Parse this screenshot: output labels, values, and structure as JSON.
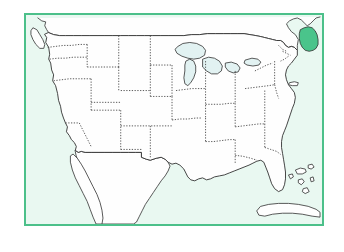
{
  "figure": {
    "kind": "map",
    "highlighted_state": "Maine",
    "title": "",
    "caption": ""
  },
  "colors": {
    "page_background": "#ffffff",
    "frame_border": "#4cc08a",
    "water_background": "#e9f8f1",
    "land_fill": "#fefefe",
    "land_outline": "#2e2e2e",
    "state_border": "#3c3c3c",
    "great_lakes_fill": "#e2f2f2",
    "highlight_fill": "#4ac48b"
  },
  "frame": {
    "x": 24,
    "y": 13,
    "width": 300,
    "height": 213,
    "border_width": 2
  },
  "features": {
    "mainland_label": "Contiguous United States",
    "great_lakes_label": "Great Lakes",
    "canada_label": "Canada",
    "mexico_label": "Mexico",
    "cuba_label": "Cuba",
    "bahamas_label": "Bahamas",
    "vancouver_island_label": "Vancouver Island",
    "long_island_label": "Long Island",
    "highlight_label": "Maine"
  },
  "geometry": {
    "mainland": "M 43 33 L 45 36 L 44 41 L 47 46 L 48 53 L 47 58 L 49 62 L 50 69 L 52 74 L 51 80 L 54 85 L 56 93 L 57 100 L 59 106 L 60 112 L 62 118 L 64 123 L 66 127 L 65 132 L 68 136 L 70 140 L 73 143 L 75 147 L 74 151 L 77 153 L 80 152 L 84 153 L 90 153 L 97 153 L 104 153 L 112 153 L 120 153 L 128 153 L 135 153 L 141 153 L 141 158 L 146 160 L 150 161 L 156 159 L 161 158 L 165 160 L 168 163 L 172 165 L 176 164 L 180 166 L 184 170 L 186 174 L 188 178 L 191 181 L 195 182 L 199 180 L 203 179 L 207 181 L 211 180 L 215 178 L 220 177 L 225 176 L 230 174 L 235 172 L 240 170 L 245 168 L 250 166 L 254 164 L 258 162 L 262 161 L 265 163 L 267 168 L 269 173 L 271 179 L 273 185 L 276 190 L 280 193 L 284 191 L 286 186 L 287 180 L 287 173 L 286 166 L 285 160 L 284 154 L 283 148 L 283 142 L 284 136 L 286 131 L 288 126 L 290 120 L 292 114 L 294 108 L 296 103 L 297 97 L 296 92 L 293 88 L 290 84 L 288 79 L 287 74 L 288 69 L 290 65 L 293 62 L 296 58 L 299 54 L 299 49 L 296 46 L 293 45 L 290 46 L 287 44 L 285 41 L 282 39 L 278 39 L 274 38 L 270 37 L 266 36 L 262 35 L 257 34 L 251 33 L 245 32 L 238 32 L 231 32 L 224 32 L 216 32 L 208 32 L 200 33 L 192 33 L 184 34 L 176 34 L 168 34 L 160 34 L 152 34 L 144 34 L 136 34 L 128 34 L 120 34 L 112 34 L 104 34 L 96 34 L 88 34 L 80 34 L 72 34 L 64 34 L 58 34 L 52 33 L 47 31 Z",
    "great_lakes": [
      "M 178 45 L 183 42 L 190 41 L 197 42 L 203 45 L 206 49 L 205 54 L 200 57 L 194 58 L 188 57 L 182 55 L 177 52 L 175 48 Z",
      "M 186 60 L 190 58 L 194 60 L 196 65 L 196 71 L 194 77 L 191 82 L 188 85 L 185 83 L 184 77 L 185 70 L 185 64 Z",
      "M 203 58 L 209 56 L 215 57 L 220 60 L 223 65 L 222 70 L 218 73 L 212 73 L 207 70 L 203 66 Z",
      "M 226 62 L 232 61 L 238 63 L 241 67 L 239 71 L 234 72 L 229 70 L 226 66 Z",
      "M 246 59 L 253 57 L 259 58 L 262 61 L 260 64 L 254 65 L 248 64 L 245 62 Z"
    ],
    "state_borders": [
      "M 46 46 L 54 45 L 62 44 L 70 44 L 78 43 L 86 43",
      "M 86 43 L 86 50 L 86 58 L 86 66",
      "M 48 58 L 56 57 L 64 57 L 72 56 L 80 56 L 86 56",
      "M 86 66 L 94 66 L 102 66 L 110 66 L 118 66",
      "M 118 34 L 118 42 L 118 50 L 118 58 L 118 66",
      "M 118 66 L 118 74 L 118 82 L 118 90",
      "M 52 80 L 60 79 L 68 78 L 76 78 L 84 78 L 90 78",
      "M 90 78 L 90 86 L 90 94 L 90 102 L 90 110",
      "M 90 110 L 98 110 L 106 110 L 114 110 L 120 110",
      "M 120 90 L 128 90 L 136 90 L 144 90 L 150 90",
      "M 150 34 L 150 42 L 150 50 L 150 58 L 150 64",
      "M 150 64 L 158 64 L 166 64 L 172 64",
      "M 150 64 L 150 72 L 150 80 L 150 88 L 150 96",
      "M 120 110 L 120 118 L 120 126 L 120 134 L 120 142 L 120 150",
      "M 150 96 L 156 96 L 162 96 L 168 96 L 172 96",
      "M 172 64 L 172 72 L 172 80 L 172 88 L 172 96",
      "M 172 96 L 172 104 L 172 112 L 172 120",
      "M 120 126 L 128 126 L 136 126 L 144 126 L 152 126 L 160 126 L 168 126 L 172 126",
      "M 150 126 L 150 134 L 150 142 L 150 150 L 150 158",
      "M 172 120 L 180 119 L 188 119 L 196 118 L 202 118",
      "M 202 50 L 202 58 L 200 64",
      "M 176 90 L 184 89 L 192 88 L 200 88 L 206 88",
      "M 206 60 L 206 68 L 206 76 L 206 84 L 206 88",
      "M 206 88 L 206 96 L 206 104 L 206 112 L 206 118",
      "M 206 118 L 206 126 L 206 134 L 206 142",
      "M 206 104 L 214 104 L 222 104 L 230 103 L 236 103",
      "M 236 70 L 236 78 L 236 86 L 236 94 L 236 103",
      "M 236 103 L 236 111 L 236 119 L 236 127",
      "M 236 127 L 244 126 L 252 125 L 260 124 L 266 124",
      "M 206 142 L 214 142 L 222 141 L 230 140 L 236 140",
      "M 236 140 L 236 148 L 236 156 L 236 164",
      "M 266 90 L 266 98 L 266 106 L 266 114 L 266 124",
      "M 266 124 L 266 132 L 266 140 L 266 148",
      "M 246 88 L 254 87 L 262 86 L 270 85 L 276 84",
      "M 276 60 L 276 68 L 276 76 L 276 84",
      "M 276 84 L 278 92 L 280 98",
      "M 256 70 L 262 67 L 268 64 L 274 62",
      "M 266 148 L 272 150 L 278 152 L 282 155",
      "M 284 50 L 288 52 L 292 54",
      "M 280 44 L 284 48 L 288 50",
      "M 290 55 L 286 58 L 282 60",
      "M 236 156 L 244 157 L 252 159 L 258 161",
      "M 120 150 L 128 150 L 136 150 L 141 150"
    ],
    "canada_outline": "M 36 16 L 40 19 L 44 20 L 43 24 L 45 28 L 47 31 L 52 33 L 58 34 L 64 34 L 72 34 L 80 34 L 88 34 L 96 34 L 104 34 L 112 34 L 120 34 L 128 34 L 136 34 L 144 34 L 152 34 L 160 34 L 168 34 L 176 34 L 184 34 L 192 33 L 200 33 L 208 32 L 216 32 L 224 32 L 231 32 L 238 32 L 245 32 L 251 33 L 257 34 L 262 35 L 266 36 L 270 37 L 274 38 L 278 39 L 282 39 L 285 41 L 287 44 L 290 46 L 293 45 L 296 46 L 299 49 L 299 44 L 300 38 L 297 33 L 293 30 L 290 26 L 288 22 L 291 19 L 295 17 L 299 16 L 303 18 L 306 21 L 309 24 L 312 22 L 315 19 L 318 16 L 322 15",
    "maine_highlight": "M 302 28 L 306 26 L 310 25 L 314 26 L 317 29 L 319 33 L 320 38 L 320 43 L 318 47 L 315 49 L 311 50 L 307 49 L 304 46 L 302 42 L 301 37 L 301 32 Z",
    "vancouver_island": "M 31 26 L 35 28 L 38 33 L 41 38 L 43 43 L 42 47 L 38 47 L 34 43 L 31 38 L 29 33 L 29 29 Z",
    "mexico": "M 74 151 L 77 153 L 80 152 L 84 153 L 90 153 L 97 153 L 104 153 L 112 153 L 120 153 L 128 153 L 135 153 L 141 153 L 141 158 L 146 160 L 150 161 L 156 159 L 161 158 L 165 160 L 168 163 L 170 167 L 168 172 L 165 177 L 161 182 L 157 188 L 153 194 L 149 200 L 145 206 L 142 212 L 139 218 L 136 224 L 133 226 L 100 226 L 97 222 L 95 216 L 93 210 L 91 204 L 89 198 L 87 192 L 85 186 L 83 180 L 81 174 L 79 168 L 77 162 L 75 157 Z",
    "baja": "M 72 155 L 76 159 L 80 165 L 84 172 L 88 180 L 92 188 L 96 196 L 99 204 L 101 212 L 102 220 L 101 226 L 95 226 L 92 219 L 89 211 L 86 203 L 82 195 L 78 187 L 74 179 L 71 171 L 69 163 L 69 157 Z",
    "cuba": "M 262 208 L 270 206 L 280 205 L 290 205 L 300 206 L 310 208 L 318 211 L 322 214 L 322 219 L 314 218 L 304 216 L 294 215 L 284 215 L 274 216 L 266 218 L 260 217 L 258 213 Z",
    "bahamas": [
      "M 297 171 L 302 169 L 307 170 L 308 173 L 304 175 L 299 175 Z",
      "M 310 166 L 314 165 L 316 168 L 313 170 L 310 169 Z",
      "M 300 181 L 304 180 L 306 183 L 303 186 L 300 184 Z",
      "M 312 179 L 315 178 L 316 182 L 313 183 Z",
      "M 305 190 L 309 189 L 311 193 L 307 195 L 304 193 Z",
      "M 290 176 L 294 175 L 295 178 L 292 180 Z"
    ],
    "long_island": "M 291 82 L 296 81 L 300 82 L 299 85 L 294 85 L 290 84 Z"
  }
}
